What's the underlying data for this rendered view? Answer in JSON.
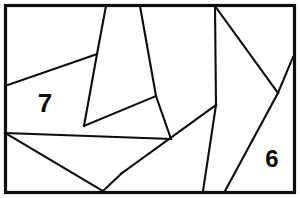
{
  "figure": {
    "background_color": "#ffffff",
    "line_color": "#0d0d0d",
    "frame": {
      "x": 5.5,
      "y": 5.5,
      "width": 289,
      "height": 187,
      "stroke_width": 3.2
    },
    "canvas": {
      "width": 300,
      "height": 198
    },
    "segments": [
      {
        "name": "upper-left-diagonal",
        "x1": 5,
        "y1": 86,
        "x2": 97,
        "y2": 54
      },
      {
        "name": "wedge-left-edge",
        "x1": 106,
        "y1": 6,
        "x2": 97,
        "y2": 54
      },
      {
        "name": "wedge-left-lower",
        "x1": 97,
        "y1": 54,
        "x2": 84,
        "y2": 126
      },
      {
        "name": "wedge-right-edge",
        "x1": 140,
        "y1": 6,
        "x2": 156,
        "y2": 96
      },
      {
        "name": "wedge-right-lower",
        "x1": 156,
        "y1": 96,
        "x2": 171,
        "y2": 139
      },
      {
        "name": "mid-band-top",
        "x1": 84,
        "y1": 126,
        "x2": 156,
        "y2": 96
      },
      {
        "name": "mid-band-bottom",
        "x1": 5,
        "y1": 133,
        "x2": 171,
        "y2": 139
      },
      {
        "name": "lower-left-crossing",
        "x1": 5,
        "y1": 133,
        "x2": 103,
        "y2": 191
      },
      {
        "name": "long-bottom-diagonal",
        "x1": 122,
        "y1": 173,
        "x2": 216,
        "y2": 105
      },
      {
        "name": "bottom-left-wedge",
        "x1": 103,
        "y1": 191,
        "x2": 122,
        "y2": 173
      },
      {
        "name": "upper-right-steep",
        "x1": 215,
        "y1": 6,
        "x2": 216,
        "y2": 105
      },
      {
        "name": "right-steep-to-bottom",
        "x1": 216,
        "y1": 105,
        "x2": 203,
        "y2": 191
      },
      {
        "name": "upper-right-diagonal",
        "x1": 215,
        "y1": 6,
        "x2": 278,
        "y2": 93
      },
      {
        "name": "right-edge-short",
        "x1": 278,
        "y1": 93,
        "x2": 293,
        "y2": 57
      },
      {
        "name": "right-long-diagonal",
        "x1": 278,
        "y1": 93,
        "x2": 225,
        "y2": 191
      }
    ],
    "labels": [
      {
        "name": "region-label-7",
        "text": "7",
        "x": 45,
        "y": 103,
        "font_size": 26
      },
      {
        "name": "region-label-6",
        "text": "6",
        "x": 272,
        "y": 158,
        "font_size": 24
      }
    ]
  }
}
